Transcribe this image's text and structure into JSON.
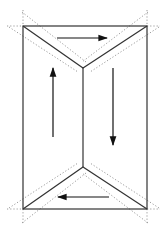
{
  "diagram": {
    "width": 166,
    "height": 234,
    "background": "#ffffff",
    "stroke_color": "#333333",
    "dotted_color": "#9a9a9a",
    "arrow_color": "#111111",
    "rectangle": {
      "x1": 23,
      "y1": 26,
      "x2": 147,
      "y2": 209
    },
    "top_apex": {
      "x": 83,
      "y": 68
    },
    "bottom_apex": {
      "x": 83,
      "y": 167
    },
    "arrows": [
      {
        "name": "top-arrow-right",
        "direction": "right",
        "x1": 57,
        "y1": 38,
        "x2": 107,
        "y2": 38
      },
      {
        "name": "left-arrow-up",
        "direction": "up",
        "x1": 53,
        "y1": 137,
        "x2": 53,
        "y2": 68
      },
      {
        "name": "right-arrow-down",
        "direction": "down",
        "x1": 113,
        "y1": 68,
        "x2": 113,
        "y2": 145
      },
      {
        "name": "bottom-arrow-left",
        "direction": "left",
        "x1": 109,
        "y1": 197,
        "x2": 58,
        "y2": 197
      }
    ]
  }
}
